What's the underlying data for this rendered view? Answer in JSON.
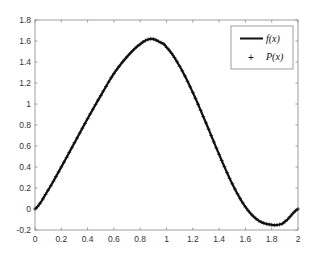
{
  "chart_data": {
    "type": "line",
    "title": "",
    "xlabel": "",
    "ylabel": "",
    "xlim": [
      0,
      2
    ],
    "ylim": [
      -0.2,
      1.8
    ],
    "grid": false,
    "legend_position": "upper right",
    "x_ticks": [
      "0",
      "0.2",
      "0.4",
      "0.6",
      "0.8",
      "1",
      "1.2",
      "1.4",
      "1.6",
      "1.8",
      "2"
    ],
    "y_ticks": [
      "-0.2",
      "0",
      "0.2",
      "0.4",
      "0.6",
      "0.8",
      "1",
      "1.2",
      "1.4",
      "1.6",
      "1.8"
    ],
    "x": [
      0,
      0.1,
      0.2,
      0.3,
      0.4,
      0.5,
      0.6,
      0.7,
      0.8,
      0.88,
      0.95,
      1.0,
      1.1,
      1.2,
      1.3,
      1.4,
      1.5,
      1.6,
      1.7,
      1.8,
      1.85,
      1.9,
      2.0
    ],
    "series": [
      {
        "name": "f(x)",
        "style": "solid black line",
        "values": [
          0,
          0.18,
          0.4,
          0.63,
          0.86,
          1.08,
          1.29,
          1.45,
          1.57,
          1.62,
          1.59,
          1.54,
          1.36,
          1.11,
          0.82,
          0.52,
          0.24,
          0.02,
          -0.11,
          -0.15,
          -0.15,
          -0.12,
          0
        ]
      },
      {
        "name": "P(x)",
        "style": "plus markers",
        "values": [
          0,
          0.18,
          0.4,
          0.63,
          0.86,
          1.08,
          1.29,
          1.45,
          1.57,
          1.62,
          1.59,
          1.54,
          1.36,
          1.11,
          0.82,
          0.52,
          0.24,
          0.02,
          -0.11,
          -0.15,
          -0.15,
          -0.12,
          0
        ]
      }
    ]
  },
  "legend": {
    "items": [
      {
        "label": "f(x)",
        "marker": "line"
      },
      {
        "label": "P(x)",
        "marker": "+"
      }
    ]
  },
  "colors": {
    "line": "#111111",
    "axis": "#888888",
    "text": "#333333"
  }
}
